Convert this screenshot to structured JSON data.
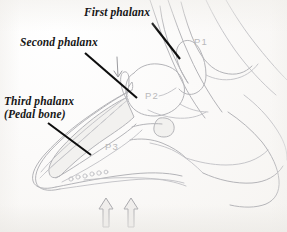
{
  "figure": {
    "title_alt": "Sagittal section of the equine hoof and pastern",
    "background_color": "#fbfaf8",
    "ink_color": "#b2b2b6",
    "leader_color": "#111111",
    "bone_label_color": "#b9b9bb"
  },
  "labels": {
    "first_phalanx": "First phalanx",
    "second_phalanx": "Second phalanx",
    "third_phalanx_line1": "Third phalanx",
    "third_phalanx_line2": "(Pedal bone)"
  },
  "bone_codes": {
    "p1": "P1",
    "p2": "P2",
    "p3": "P3"
  },
  "annotations": {
    "pointer_down_icon": "down-arrow-icon",
    "load_arrow_left_icon": "up-arrow-icon",
    "load_arrow_right_icon": "up-arrow-icon",
    "leader_first_icon": "leader-line",
    "leader_second_icon": "leader-line",
    "leader_third_icon": "leader-line"
  }
}
